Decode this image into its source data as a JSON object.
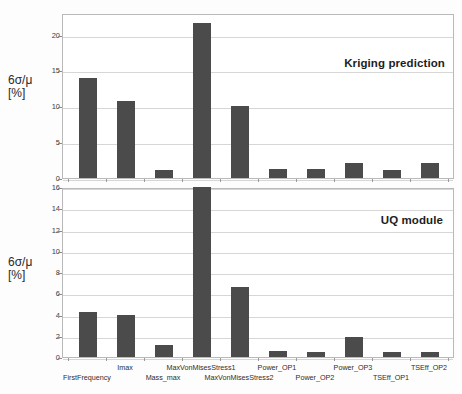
{
  "figure": {
    "background_color": "#fdfdfd",
    "bar_color": "#4b4b4b",
    "grid_color": "#d6d6d6",
    "axis_color": "#8a8a8a"
  },
  "axis_title": {
    "line1": "6σ/μ",
    "line2": "[%]"
  },
  "categories": [
    "FirstFrequency",
    "Imax",
    "Mass_max",
    "MaxVonMisesStress1",
    "MaxVonMisesStress2",
    "Power_OP1",
    "Power_OP2",
    "Power_OP3",
    "TSEff_OP1",
    "TSEff_OP2"
  ],
  "chart_data": [
    {
      "type": "bar",
      "title": "Kriging prediction",
      "xlabel": "",
      "ylabel": "6σ/μ [%]",
      "ylim": [
        0,
        23
      ],
      "yticks": [
        0,
        5,
        10,
        15,
        20
      ],
      "ytick_labels": [
        "0",
        "5",
        "10",
        "15",
        "20"
      ],
      "grid": true,
      "legend": "none",
      "annotation_position": "top-right",
      "categories": [
        "FirstFrequency",
        "Imax",
        "Mass_max",
        "MaxVonMisesStress1",
        "MaxVonMisesStress2",
        "Power_OP1",
        "Power_OP2",
        "Power_OP3",
        "TSEff_OP1",
        "TSEff_OP2"
      ],
      "values": [
        13.9,
        10.8,
        1.15,
        21.6,
        10.1,
        1.3,
        1.3,
        2.05,
        1.15,
        2.05
      ]
    },
    {
      "type": "bar",
      "title": "UQ module",
      "xlabel": "",
      "ylabel": "6σ/μ [%]",
      "ylim": [
        0,
        16
      ],
      "yticks": [
        0,
        2,
        4,
        6,
        8,
        10,
        12,
        14,
        16
      ],
      "ytick_labels": [
        "0",
        "2",
        "4",
        "6",
        "8",
        "10",
        "12",
        "14",
        "16"
      ],
      "grid": true,
      "legend": "none",
      "annotation_position": "top-right",
      "categories": [
        "FirstFrequency",
        "Imax",
        "Mass_max",
        "MaxVonMisesStress1",
        "MaxVonMisesStress2",
        "Power_OP1",
        "Power_OP2",
        "Power_OP3",
        "TSEff_OP1",
        "TSEff_OP2"
      ],
      "values": [
        4.25,
        4.0,
        1.15,
        16.0,
        6.6,
        0.55,
        0.45,
        1.9,
        0.5,
        0.45
      ]
    }
  ]
}
